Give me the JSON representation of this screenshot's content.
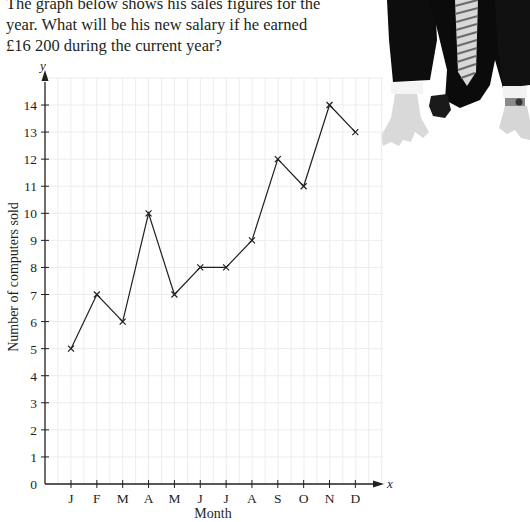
{
  "question": {
    "lines": [
      "The graph below shows his sales figures for the",
      "year. What will be his new salary if he earned",
      "£16 200 during the current year?"
    ]
  },
  "photo": {
    "description": "businessman in suit and striped tie crouched in sprinter starting position, wearing wristwatch"
  },
  "colors": {
    "line": "#231f20",
    "grid": "#ececec",
    "text": "#231f20"
  },
  "chart_data": {
    "type": "line",
    "title": "",
    "xlabel": "Month",
    "ylabel": "Number of computers sold",
    "x_axis_var": "x",
    "y_axis_var": "y",
    "categories": [
      "J",
      "F",
      "M",
      "A",
      "M",
      "J",
      "J",
      "A",
      "S",
      "O",
      "N",
      "D"
    ],
    "series": [
      {
        "name": "Computers sold",
        "marker": "x",
        "values": [
          5,
          7,
          6,
          10,
          7,
          8,
          8,
          9,
          12,
          11,
          14,
          13
        ]
      }
    ],
    "y_ticks": [
      "0",
      "1",
      "2",
      "3",
      "4",
      "5",
      "6",
      "7",
      "8",
      "9",
      "10",
      "11",
      "12",
      "13",
      "14"
    ],
    "ylim": [
      0,
      14
    ],
    "grid": true,
    "legend": "none"
  }
}
